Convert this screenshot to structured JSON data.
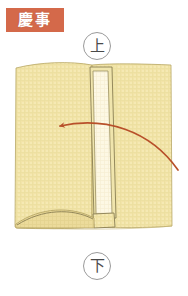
{
  "page": {
    "background_color": "#ffffff",
    "width": 188,
    "height": 296
  },
  "category": {
    "label": "慶事",
    "meaning": "auspicious occasion",
    "background_color": "#d4694a",
    "text_color": "#ffffff"
  },
  "orientation": {
    "top": {
      "label": "上",
      "meaning": "up",
      "circle_color": "#9a9a9a",
      "text_color": "#4a4a4a"
    },
    "bottom": {
      "label": "下",
      "meaning": "down",
      "circle_color": "#9a9a9a",
      "text_color": "#4a4a4a"
    }
  },
  "illustration": {
    "name": "folded-paper-diagram",
    "paper_fill": "#f2e3a8",
    "paper_shade": "#eadb9b",
    "paper_outline": "#b5a35f",
    "strip_fill": "#fdf8e4",
    "strip_outline": "#8a7f53",
    "arrow_color": "#b8502a",
    "arrow_direction": "right-to-left",
    "arrow_label": "fold direction",
    "texture": "woven grid"
  }
}
